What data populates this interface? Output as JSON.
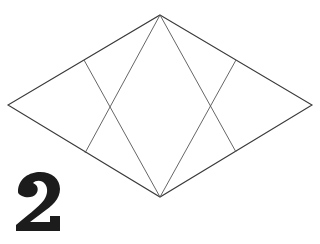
{
  "diagram": {
    "type": "origami-fold-step",
    "step_number": "2",
    "line_color": "#3a3a3a",
    "numeral_color": "#1c1c1c",
    "shape": "rhombus",
    "vertices": {
      "top": [
        160,
        15
      ],
      "left": [
        8,
        105
      ],
      "right": [
        312,
        105
      ],
      "bottom": [
        160,
        197
      ]
    },
    "crease_lines": [
      {
        "from": [
          84,
          60
        ],
        "to": [
          160,
          197
        ]
      },
      {
        "from": [
          160,
          15
        ],
        "to": [
          85,
          153
        ]
      },
      {
        "from": [
          236,
          60
        ],
        "to": [
          160,
          197
        ]
      },
      {
        "from": [
          160,
          15
        ],
        "to": [
          236,
          152
        ]
      }
    ]
  }
}
